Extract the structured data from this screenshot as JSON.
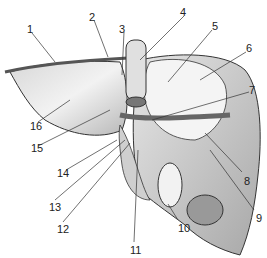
{
  "diagram": {
    "background": "#ffffff",
    "labels": [
      {
        "id": "1",
        "text": "1",
        "x": 27,
        "y": 24
      },
      {
        "id": "2",
        "text": "2",
        "x": 89,
        "y": 12
      },
      {
        "id": "3",
        "text": "3",
        "x": 119,
        "y": 24
      },
      {
        "id": "4",
        "text": "4",
        "x": 180,
        "y": 7
      },
      {
        "id": "5",
        "text": "5",
        "x": 212,
        "y": 21
      },
      {
        "id": "6",
        "text": "6",
        "x": 246,
        "y": 43
      },
      {
        "id": "7",
        "text": "7",
        "x": 249,
        "y": 85
      },
      {
        "id": "8",
        "text": "8",
        "x": 244,
        "y": 176
      },
      {
        "id": "9",
        "text": "9",
        "x": 256,
        "y": 213
      },
      {
        "id": "10",
        "text": "10",
        "x": 178,
        "y": 223
      },
      {
        "id": "11",
        "text": "11",
        "x": 130,
        "y": 245
      },
      {
        "id": "12",
        "text": "12",
        "x": 57,
        "y": 224
      },
      {
        "id": "13",
        "text": "13",
        "x": 49,
        "y": 202
      },
      {
        "id": "14",
        "text": "14",
        "x": 57,
        "y": 168
      },
      {
        "id": "15",
        "text": "15",
        "x": 31,
        "y": 143
      },
      {
        "id": "16",
        "text": "16",
        "x": 30,
        "y": 121
      }
    ]
  }
}
